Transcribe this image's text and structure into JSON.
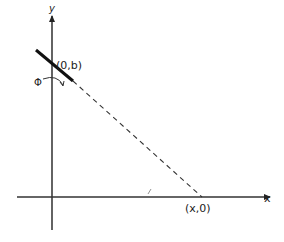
{
  "diagram": {
    "axes": {
      "x_label": "x",
      "y_label": "y"
    },
    "points": {
      "y_intercept": "(0,b)",
      "x_intercept": "(x,0)"
    },
    "angle_label": "Φ",
    "tick_mark": "ℓ",
    "colors": {
      "stroke": "#222222",
      "background": "#ffffff"
    }
  }
}
